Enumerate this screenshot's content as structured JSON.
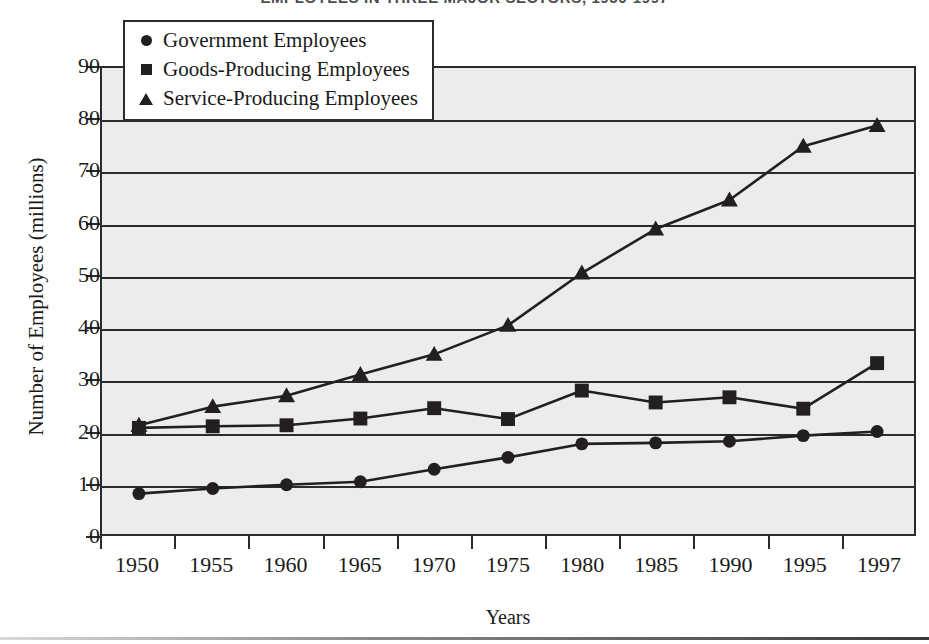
{
  "chart_data": {
    "type": "line",
    "title": "EMPLOYEES IN THREE MAJOR SECTORS, 1950-1997",
    "xlabel": "Years",
    "ylabel": "Number of Employees (millions)",
    "x": [
      1950,
      1955,
      1960,
      1965,
      1970,
      1975,
      1980,
      1985,
      1990,
      1995,
      1997
    ],
    "categories": [
      "1950",
      "1955",
      "1960",
      "1965",
      "1970",
      "1975",
      "1980",
      "1985",
      "1990",
      "1995",
      "1997"
    ],
    "ylim": [
      0,
      90
    ],
    "yticks": [
      0,
      10,
      20,
      30,
      40,
      50,
      60,
      70,
      80,
      90
    ],
    "grid": true,
    "legend_position": "top-left",
    "series": [
      {
        "name": "Government Employees",
        "marker": "circle",
        "values": [
          7.8,
          8.8,
          9.5,
          10.1,
          12.5,
          14.8,
          17.4,
          17.6,
          17.9,
          19.0,
          19.8
        ]
      },
      {
        "name": "Goods-Producing Employees",
        "marker": "square",
        "values": [
          20.5,
          20.8,
          21.0,
          22.3,
          24.3,
          22.2,
          27.7,
          25.4,
          26.4,
          24.2,
          33.0
        ]
      },
      {
        "name": "Service-Producing Employees",
        "marker": "triangle",
        "values": [
          21.0,
          24.6,
          26.7,
          30.8,
          34.7,
          40.3,
          50.4,
          58.9,
          64.5,
          74.9,
          78.9
        ]
      }
    ]
  },
  "legend": {
    "items": [
      {
        "label": "Government Employees",
        "marker": "circle"
      },
      {
        "label": "Goods-Producing Employees",
        "marker": "square"
      },
      {
        "label": "Service-Producing Employees",
        "marker": "triangle"
      }
    ]
  },
  "colors": {
    "ink": "#231f20",
    "axis": "#2b2b2b",
    "plot_background": "#ececed",
    "page_background": "#ffffff",
    "title_text": "#4d4d4d"
  }
}
